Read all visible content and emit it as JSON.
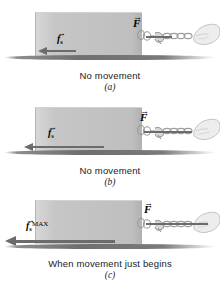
{
  "figure": {
    "colors": {
      "block_fill": "#c6c6c6",
      "ground_line": "#6f6f6f",
      "vector": "#6b6b6b",
      "label_text": "#000000",
      "caption_text": "#232323",
      "background": "#ffffff"
    }
  },
  "panels": [
    {
      "id": "a",
      "letter": "(a)",
      "caption": "No movement",
      "applied_force": {
        "symbol": "F",
        "vector_bar": "→"
      },
      "friction_force": {
        "symbol": "f",
        "subscript": "s",
        "superscript": "",
        "vector_bar": "→"
      },
      "friction_arrow_length_px": 30,
      "applied_arrow_length_px": 26
    },
    {
      "id": "b",
      "letter": "(b)",
      "caption": "No movement",
      "applied_force": {
        "symbol": "F",
        "vector_bar": "→"
      },
      "friction_force": {
        "symbol": "f",
        "subscript": "s",
        "superscript": "",
        "vector_bar": "→"
      },
      "friction_arrow_length_px": 72,
      "applied_arrow_length_px": 48
    },
    {
      "id": "c",
      "letter": "(c)",
      "caption": "When movement just begins",
      "applied_force": {
        "symbol": "F",
        "vector_bar": "→"
      },
      "friction_force": {
        "symbol": "f",
        "subscript": "s",
        "superscript": "MAX",
        "vector_bar": "→"
      },
      "friction_arrow_length_px": 100,
      "applied_arrow_length_px": 62
    }
  ]
}
